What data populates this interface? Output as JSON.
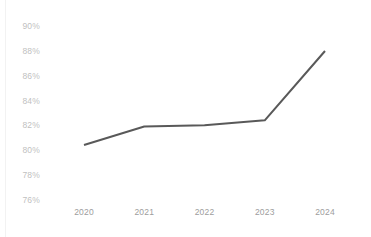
{
  "chart_data": {
    "type": "line",
    "title": "",
    "subtitle": "",
    "xlabel": "",
    "ylabel": "",
    "categories": [
      "2020",
      "2021",
      "2022",
      "2023",
      "2024"
    ],
    "values": [
      80.4,
      81.9,
      82.0,
      82.4,
      88.0
    ],
    "series": [
      {
        "name": "",
        "values": [
          80.4,
          81.9,
          82.0,
          82.4,
          88.0
        ],
        "color": "#595959"
      }
    ],
    "ylim": [
      76,
      90
    ],
    "ytick_values": [
      76,
      78,
      80,
      82,
      84,
      86,
      88,
      90
    ],
    "ytick_labels": [
      "76%",
      "78%",
      "80%",
      "82%",
      "84%",
      "86%",
      "88%",
      "90%"
    ],
    "xtick_labels": [
      "2020",
      "2021",
      "2022",
      "2023",
      "2024"
    ],
    "grid": false,
    "legend": false,
    "legend_position": "none",
    "markers": false,
    "line_width": 2,
    "annotations": []
  },
  "axes": {
    "y_ticks": [
      {
        "label": "90%",
        "value": 90
      },
      {
        "label": "88%",
        "value": 88
      },
      {
        "label": "86%",
        "value": 86
      },
      {
        "label": "84%",
        "value": 84
      },
      {
        "label": "82%",
        "value": 82
      },
      {
        "label": "80%",
        "value": 80
      },
      {
        "label": "78%",
        "value": 78
      },
      {
        "label": "76%",
        "value": 76
      }
    ],
    "x_ticks": [
      {
        "label": "2020"
      },
      {
        "label": "2021"
      },
      {
        "label": "2022"
      },
      {
        "label": "2023"
      },
      {
        "label": "2024"
      }
    ]
  },
  "colors": {
    "line": "#595959",
    "y_tick_text": "#bfbfbf",
    "x_tick_text": "#9d9d9d",
    "background": "#ffffff",
    "left_rule": "#f2f2f2"
  },
  "footnote": {
    "text": ""
  }
}
